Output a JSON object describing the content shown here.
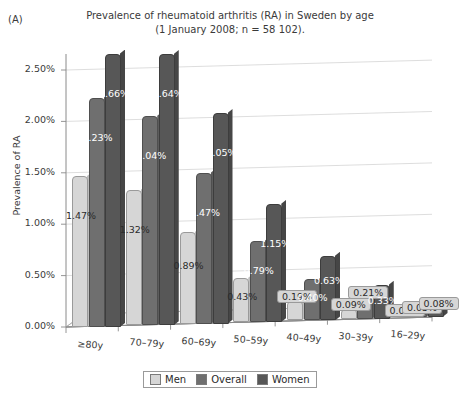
{
  "panel_label": "(A)",
  "title": {
    "line1": "Prevalence of rheumatoid arthritis (RA) in Sweden by age",
    "line2": "(1 January 2008; n = 58 102)."
  },
  "axes": {
    "ylabel": "Prevalence of RA",
    "yticks": [
      "0.00%",
      "0.50%",
      "1.00%",
      "1.50%",
      "2.00%",
      "2.50%"
    ],
    "ytick_values": [
      0,
      0.5,
      1.0,
      1.5,
      2.0,
      2.5
    ],
    "xlabel": ""
  },
  "legend": {
    "position": "bottom",
    "items": [
      {
        "label": "Men",
        "color": "#d6d6d6"
      },
      {
        "label": "Overall",
        "color": "#6f6f6f"
      },
      {
        "label": "Women",
        "color": "#575757"
      }
    ]
  },
  "chart_data": {
    "type": "bar",
    "title": "Prevalence of rheumatoid arthritis (RA) in Sweden by age (1 January 2008; n = 58 102).",
    "xlabel": "",
    "ylabel": "Prevalence of RA",
    "ylim": [
      0,
      2.75
    ],
    "grid": true,
    "units": "%",
    "categories": [
      "≥80y",
      "70–79y",
      "60–69y",
      "50–59y",
      "40–49y",
      "30–39y",
      "16–29y"
    ],
    "series": [
      {
        "name": "Men",
        "color": "#d6d6d6",
        "values": [
          1.47,
          1.32,
          0.89,
          0.43,
          0.19,
          0.09,
          0.02
        ],
        "labels": [
          "1.47%",
          "1.32%",
          "0.89%",
          "0.43%",
          "0.19%",
          "0.09%",
          "0.02%"
        ]
      },
      {
        "name": "Overall",
        "color": "#6f6f6f",
        "values": [
          2.23,
          2.04,
          1.47,
          0.79,
          0.4,
          0.21,
          0.05
        ],
        "labels": [
          "2.23%",
          "2.04%",
          "1.47%",
          "0.79%",
          "0.40%",
          "0.21%",
          "0.05%"
        ]
      },
      {
        "name": "Women",
        "color": "#575757",
        "values": [
          2.66,
          2.64,
          2.05,
          1.15,
          0.63,
          0.33,
          0.08
        ],
        "labels": [
          "2.66%",
          "2.64%",
          "2.05%",
          "1.15%",
          "0.63%",
          "0.33%",
          "0.08%"
        ]
      }
    ]
  }
}
